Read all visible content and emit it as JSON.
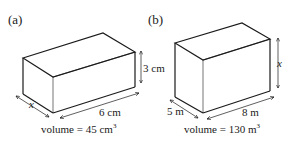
{
  "figures": [
    {
      "label": "(a)",
      "shape": "cuboid",
      "dimensions": {
        "width": "x",
        "length": "6 cm",
        "height": "3 cm"
      },
      "volume": {
        "text": "volume = 45 cm",
        "exponent": "3"
      }
    },
    {
      "label": "(b)",
      "shape": "cuboid",
      "dimensions": {
        "width": "5 m",
        "length": "8 m",
        "height": "x"
      },
      "volume": {
        "text": "volume = 130 m",
        "exponent": "3"
      }
    }
  ],
  "colors": {
    "stroke": "#1a1a1a",
    "background": "#ffffff"
  }
}
